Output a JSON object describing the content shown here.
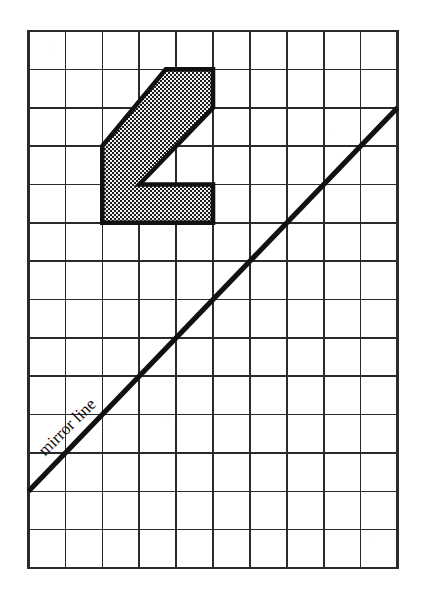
{
  "figure": {
    "background_color": "#ffffff",
    "ink_color": "#1a1a1a",
    "grid": {
      "name": "square-grid",
      "origin_x": 28.5,
      "origin_y": 31.0,
      "cols": 10,
      "rows": 14,
      "cell_width": 36.9,
      "cell_height": 38.36,
      "line_color": "#2b2b2b",
      "line_width": 1.6,
      "border_width": 2.2,
      "visible": true
    },
    "mirror_line": {
      "label": "mirror line",
      "label_rotation_deg": -45,
      "stroke_color": "#111111",
      "stroke_width": 5.2,
      "start_col": 0,
      "start_row": 12,
      "end_col": 10,
      "end_row": 2,
      "label_anchor_col": 0.45,
      "label_anchor_row": 11.1
    },
    "shape": {
      "name": "shaded-L-polygon",
      "fill_pattern": "dotted-hatch",
      "fill_color": "#e9e9e9",
      "dot_color": "#1c1c1c",
      "outline_color": "#111111",
      "outline_width": 4.6,
      "vertices_grid": [
        [
          3.72,
          1.0
        ],
        [
          5.0,
          1.0
        ],
        [
          5.0,
          2.0
        ],
        [
          3.0,
          4.0
        ],
        [
          5.0,
          4.0
        ],
        [
          5.0,
          5.0
        ],
        [
          2.0,
          5.0
        ],
        [
          2.0,
          3.0
        ]
      ]
    }
  }
}
